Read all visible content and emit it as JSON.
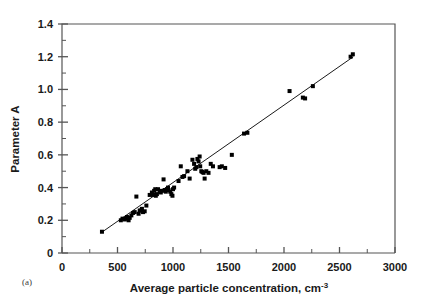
{
  "figure": {
    "panel_label": "(a)",
    "background_color": "#ffffff",
    "frame_color": "#555555",
    "marker_color": "#000000",
    "fit_line_color": "#1a1a1a"
  },
  "chart_data": {
    "type": "scatter",
    "title": "",
    "xlabel_main": "Average particle concentration, cm",
    "xlabel_sup": "-3",
    "ylabel": "Parameter A",
    "xlim": [
      0,
      3000
    ],
    "ylim": [
      0,
      1.4
    ],
    "xticks": [
      0,
      500,
      1000,
      1500,
      2000,
      2500,
      3000
    ],
    "xtick_labels": [
      "0",
      "500",
      "1000",
      "1500",
      "2000",
      "2500",
      "3000"
    ],
    "xminor_step": 250,
    "yticks": [
      0,
      0.2,
      0.4,
      0.6,
      0.8,
      1.0,
      1.2,
      1.4
    ],
    "ytick_labels": [
      "0",
      "0.2",
      "0.4",
      "0.6",
      "0.8",
      "1.0",
      "1.2",
      "1.4"
    ],
    "yminor_step": 0.1,
    "grid": false,
    "legend": null,
    "marker": "square",
    "marker_size": 4,
    "series": [
      {
        "name": "Parameter A vs average particle concentration",
        "x": [
          360,
          530,
          545,
          565,
          575,
          585,
          600,
          610,
          625,
          640,
          655,
          670,
          690,
          700,
          715,
          720,
          730,
          745,
          760,
          790,
          810,
          820,
          830,
          840,
          845,
          855,
          865,
          880,
          890,
          900,
          915,
          925,
          935,
          945,
          955,
          960,
          975,
          985,
          995,
          1000,
          1010,
          1050,
          1070,
          1085,
          1100,
          1130,
          1150,
          1175,
          1190,
          1200,
          1210,
          1220,
          1230,
          1240,
          1245,
          1255,
          1265,
          1275,
          1285,
          1300,
          1320,
          1340,
          1360,
          1420,
          1440,
          1470,
          1530,
          1640,
          1670,
          2050,
          2170,
          2190,
          2260,
          2600,
          2620
        ],
        "y": [
          0.13,
          0.2,
          0.21,
          0.205,
          0.21,
          0.22,
          0.2,
          0.215,
          0.23,
          0.245,
          0.25,
          0.345,
          0.24,
          0.26,
          0.26,
          0.27,
          0.25,
          0.255,
          0.29,
          0.355,
          0.37,
          0.355,
          0.38,
          0.39,
          0.35,
          0.36,
          0.39,
          0.375,
          0.37,
          0.38,
          0.45,
          0.385,
          0.375,
          0.39,
          0.4,
          0.385,
          0.375,
          0.36,
          0.35,
          0.39,
          0.4,
          0.44,
          0.53,
          0.465,
          0.47,
          0.5,
          0.455,
          0.57,
          0.545,
          0.515,
          0.525,
          0.575,
          0.56,
          0.59,
          0.53,
          0.5,
          0.495,
          0.49,
          0.455,
          0.5,
          0.49,
          0.545,
          0.53,
          0.525,
          0.53,
          0.52,
          0.6,
          0.73,
          0.735,
          0.99,
          0.95,
          0.945,
          1.02,
          1.2,
          1.215
        ]
      }
    ],
    "fit_line": {
      "type": "linear",
      "x_start": 355,
      "x_end": 2625,
      "y_start": 0.125,
      "y_end": 1.2
    }
  }
}
